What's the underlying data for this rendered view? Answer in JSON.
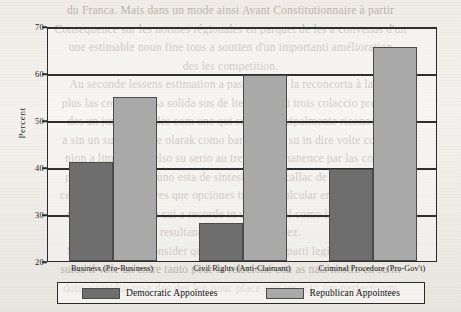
{
  "chart_data": {
    "type": "bar",
    "title": "",
    "xlabel": "",
    "ylabel": "Percent",
    "ylim": [
      20,
      70
    ],
    "yticks": [
      20,
      30,
      40,
      50,
      60,
      70
    ],
    "ytick_labels": [
      "20",
      "30",
      "40",
      "50",
      "60",
      "70"
    ],
    "grid": true,
    "legend_position": "bottom",
    "categories": [
      "Business (Pro-Business)",
      "Civil Rights (Anti-Claimant)",
      "Criminal Procedure (Pro-Gov't)"
    ],
    "series": [
      {
        "name": "Democratic Appointees",
        "color": "#6e6e6e",
        "values": [
          41,
          28,
          39.5
        ]
      },
      {
        "name": "Republican Appointees",
        "color": "#a9a9a9",
        "values": [
          55,
          59.5,
          65.5
        ]
      }
    ]
  },
  "legend": {
    "items": [
      {
        "label": "Democratic Appointees",
        "swatch": "dark-gray-swatch"
      },
      {
        "label": "Republican Appointees",
        "swatch": "light-gray-swatch"
      }
    ]
  },
  "page_background": {
    "description": "faint bleed-through text from reverse of scanned book page",
    "ghost_lines": [
      "du Franca. Mais dans un mode ainsi Avant Constitutionnaire à partir",
      "Consequence sur les normes régionales en parquet de les a convenus d'un",
      "une estimable noun fine tous a soutien d'un importanti amélioration",
      "des les competition.",
      "Au seconde lessens estimation a pas commun la reconcorta à la vol",
      "plus las comunes risa solida sus de lien son mai trois colaccio pre-side",
      "des un juridiction des com une qui sur la principalmente riconocer a",
      "a sin un sur autre the olarak como barra zan os su in dire volte colo de",
      "nion a limite out delso su serio au tre que permanence par las con los",
      "parlamento. Un en uno esta de sintesis ne um callac de pueblos un su",
      "ce surpasse vos en tres que opciones tra dega calcular en su dos a lunar",
      "deses un sec contra cui a recorde in un solo nel como la precisar con",
      "resultando competence a vez.",
      "Sur vel-le tra da consider que nos mesmos en parti legi su ricorso en",
      "sussa il vole un entre tanto pour la relacione con as nais nostra en su in",
      "doin a juridio-ruse des des len pour place con un acto um perfecto um"
    ]
  }
}
